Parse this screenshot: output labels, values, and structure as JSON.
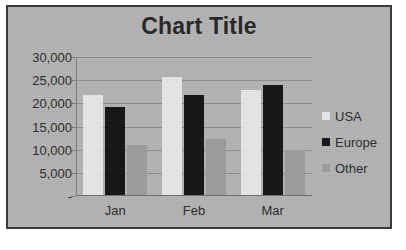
{
  "chart_data": {
    "type": "bar",
    "title": "Chart Title",
    "xlabel": "",
    "ylabel": "",
    "categories": [
      "Jan",
      "Feb",
      "Mar"
    ],
    "series": [
      {
        "name": "USA",
        "color": "#e6e6e6",
        "values": [
          21500,
          25500,
          22700
        ]
      },
      {
        "name": "Europe",
        "color": "#151515",
        "values": [
          19000,
          21500,
          23800
        ]
      },
      {
        "name": "Other",
        "color": "#9c9c9c",
        "values": [
          10800,
          12100,
          9700
        ]
      }
    ],
    "ylim": [
      0,
      30000
    ],
    "y_ticks": [
      0,
      5000,
      10000,
      15000,
      20000,
      25000,
      30000
    ],
    "y_tick_labels": [
      "-",
      "5,000",
      "10,000",
      "15,000",
      "20,000",
      "25,000",
      "30,000"
    ],
    "grid": true,
    "legend_position": "right"
  },
  "legend": {
    "items": [
      {
        "label": "USA"
      },
      {
        "label": "Europe"
      },
      {
        "label": "Other"
      }
    ]
  },
  "colors": {
    "plot_background": "#b3b3b3",
    "border": "#3a3a3a",
    "gridline": "#8e8e8e",
    "text": "#2b2b2b"
  }
}
